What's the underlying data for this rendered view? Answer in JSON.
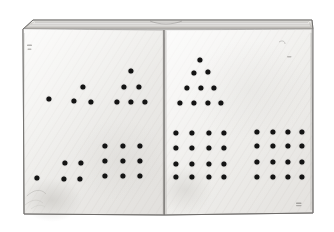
{
  "scene": {
    "title": "Open book with dot patterns",
    "description": "A photograph of an open book, both pages blank and cream-white, printed with groups of black dots arranged in triangular and square numeric figures.",
    "background_color": "#ffffff",
    "page_color": "#f4f3f1",
    "page_shadow_color": "#d8d6d3",
    "ink_color": "#141414",
    "edge_color": "#8d8b89"
  },
  "book": {
    "name": "open-book",
    "left_page_label": "left-page",
    "right_page_label": "right-page",
    "spine_label": "book-spine",
    "top_edge_label": "book-top-edge",
    "page_block_label": "page-block",
    "left_page_bounds": {
      "x": 22,
      "y": 28,
      "w": 142,
      "h": 187
    },
    "right_page_bounds": {
      "x": 164,
      "y": 28,
      "w": 148,
      "h": 186
    },
    "spine_x": 164,
    "spine_top_y": 30,
    "spine_bottom_y": 215
  },
  "dot_style": {
    "diameter": 5.2,
    "color": "#141414"
  },
  "chart_data": {
    "type": "scatter",
    "xlabel": "",
    "ylabel": "",
    "xlim": [
      0,
      334
    ],
    "ylim": [
      232,
      0
    ],
    "grid": false,
    "legend": "none",
    "total_dots": 57,
    "groups": [
      {
        "name": "left-top-monad",
        "page": "left",
        "row": "top",
        "figure": "single point",
        "count": 1,
        "shape": "point",
        "points": [
          [
            49.0,
            98.7
          ]
        ]
      },
      {
        "name": "left-top-triangle-3",
        "page": "left",
        "row": "top",
        "figure": "triangular number 3",
        "count": 3,
        "shape": "triangle",
        "rows": [
          1,
          2
        ],
        "points": [
          [
            83.3,
            86.7
          ],
          [
            74.3,
            101.3
          ],
          [
            90.5,
            101.5
          ]
        ]
      },
      {
        "name": "left-top-triangle-6",
        "page": "left",
        "row": "top",
        "figure": "triangular number 6",
        "count": 6,
        "shape": "triangle",
        "rows": [
          1,
          2,
          3
        ],
        "points": [
          [
            130.7,
            70.7
          ],
          [
            124.3,
            87.3
          ],
          [
            138.7,
            87.0
          ],
          [
            117.3,
            101.7
          ],
          [
            131.0,
            101.7
          ],
          [
            145.0,
            101.7
          ]
        ]
      },
      {
        "name": "left-bottom-monad",
        "page": "left",
        "row": "bottom",
        "figure": "single point",
        "count": 1,
        "shape": "point",
        "points": [
          [
            36.7,
            178.0
          ]
        ]
      },
      {
        "name": "left-bottom-square-4",
        "page": "left",
        "row": "bottom",
        "figure": "square number 4",
        "count": 4,
        "shape": "square",
        "grid": [
          2,
          2
        ],
        "points": [
          [
            65.0,
            162.7
          ],
          [
            80.7,
            162.7
          ],
          [
            64.3,
            179.0
          ],
          [
            80.3,
            178.7
          ]
        ]
      },
      {
        "name": "left-bottom-square-9",
        "page": "left",
        "row": "bottom",
        "figure": "square number 9",
        "count": 9,
        "shape": "square",
        "grid": [
          3,
          3
        ],
        "points": [
          [
            105.3,
            146.0
          ],
          [
            122.7,
            146.0
          ],
          [
            140.0,
            146.0
          ],
          [
            105.3,
            161.0
          ],
          [
            122.7,
            161.0
          ],
          [
            140.0,
            161.0
          ],
          [
            105.3,
            176.3
          ],
          [
            122.7,
            176.3
          ],
          [
            140.0,
            176.3
          ]
        ]
      },
      {
        "name": "right-top-triangle-10",
        "page": "right",
        "row": "top",
        "figure": "triangular number 10",
        "count": 10,
        "shape": "triangle",
        "rows": [
          1,
          2,
          3,
          4
        ],
        "points": [
          [
            200.3,
            60.3
          ],
          [
            193.7,
            72.7
          ],
          [
            207.7,
            72.3
          ],
          [
            187.0,
            88.3
          ],
          [
            200.7,
            88.3
          ],
          [
            214.3,
            88.0
          ],
          [
            180.0,
            102.7
          ],
          [
            194.0,
            102.7
          ],
          [
            207.7,
            102.7
          ],
          [
            221.3,
            102.7
          ]
        ]
      },
      {
        "name": "right-bottom-square-16-left",
        "page": "right",
        "row": "bottom",
        "figure": "square number 16",
        "count": 16,
        "shape": "square",
        "grid": [
          4,
          4
        ],
        "points": [
          [
            176.3,
            133.0
          ],
          [
            192.3,
            133.0
          ],
          [
            208.7,
            133.0
          ],
          [
            224.0,
            133.0
          ],
          [
            176.3,
            148.3
          ],
          [
            192.3,
            148.3
          ],
          [
            208.7,
            148.3
          ],
          [
            224.0,
            148.3
          ],
          [
            176.3,
            164.0
          ],
          [
            192.3,
            164.0
          ],
          [
            208.7,
            164.0
          ],
          [
            224.0,
            164.0
          ],
          [
            176.3,
            177.3
          ],
          [
            192.3,
            177.3
          ],
          [
            208.7,
            177.3
          ],
          [
            224.0,
            177.3
          ]
        ]
      },
      {
        "name": "right-bottom-square-16-right",
        "page": "right",
        "row": "bottom",
        "figure": "square number 16",
        "count": 16,
        "shape": "square",
        "grid": [
          4,
          4
        ],
        "points": [
          [
            257.3,
            131.7
          ],
          [
            272.7,
            131.7
          ],
          [
            288.3,
            131.7
          ],
          [
            302.0,
            131.7
          ],
          [
            257.3,
            146.3
          ],
          [
            272.7,
            146.3
          ],
          [
            288.3,
            146.3
          ],
          [
            302.0,
            146.3
          ],
          [
            257.3,
            161.7
          ],
          [
            272.7,
            161.7
          ],
          [
            288.3,
            161.7
          ],
          [
            302.0,
            161.7
          ],
          [
            257.3,
            177.3
          ],
          [
            272.7,
            177.3
          ],
          [
            288.3,
            177.3
          ],
          [
            302.0,
            177.3
          ]
        ]
      }
    ],
    "blemishes": [
      {
        "name": "mark-top-left",
        "x": 28,
        "y": 45,
        "w": 5,
        "h": 2
      },
      {
        "name": "mark-top-left-lower",
        "x": 28,
        "y": 49,
        "w": 4,
        "h": 2
      },
      {
        "name": "mark-top-right",
        "x": 281,
        "y": 43,
        "w": 5,
        "h": 3
      },
      {
        "name": "mark-right-mid",
        "x": 288,
        "y": 57,
        "w": 4,
        "h": 2
      },
      {
        "name": "mark-bottom-right",
        "x": 297,
        "y": 203,
        "w": 5,
        "h": 3
      },
      {
        "name": "smudge-bottom-left",
        "x": 24,
        "y": 192,
        "w": 22,
        "h": 18
      }
    ]
  }
}
